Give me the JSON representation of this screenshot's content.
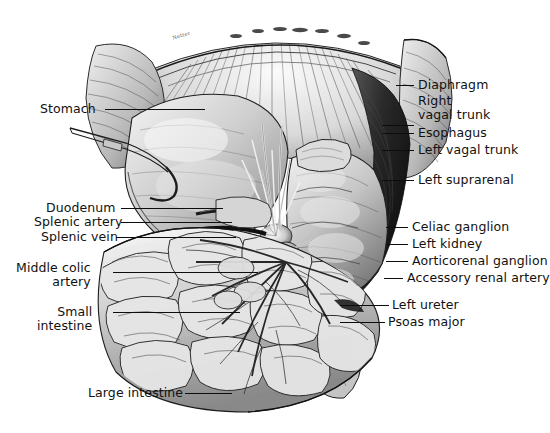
{
  "figure": {
    "signature": "Netter",
    "ink_color": "#0d0d0d",
    "label_color": "#111111",
    "background": "#ffffff"
  },
  "labels_right": [
    {
      "name": "diaphragm",
      "text": "Diaphragm",
      "x": 418,
      "y": 78,
      "line_x1": 396,
      "line_x2": 414,
      "line_y": 85
    },
    {
      "name": "right-vagal-trunk",
      "text": "Right\nvagal trunk",
      "x": 418,
      "y": 94,
      "line_x1": 382,
      "line_x2": 414,
      "line_y": 125
    },
    {
      "name": "esophagus",
      "text": "Esophagus",
      "x": 418,
      "y": 126,
      "line_x1": 382,
      "line_x2": 414,
      "line_y": 133
    },
    {
      "name": "left-vagal-trunk",
      "text": "Left vagal trunk",
      "x": 418,
      "y": 143,
      "line_x1": 382,
      "line_x2": 414,
      "line_y": 150
    },
    {
      "name": "left-suprarenal",
      "text": "Left suprarenal",
      "x": 418,
      "y": 173,
      "line_x1": 382,
      "line_x2": 414,
      "line_y": 180
    },
    {
      "name": "celiac-ganglion",
      "text": "Celiac ganglion",
      "x": 412,
      "y": 220,
      "line_x1": 386,
      "line_x2": 408,
      "line_y": 227
    },
    {
      "name": "left-kidney",
      "text": "Left kidney",
      "x": 412,
      "y": 237,
      "line_x1": 386,
      "line_x2": 408,
      "line_y": 244
    },
    {
      "name": "aorticorenal-ganglion",
      "text": "Aorticorenal ganglion",
      "x": 412,
      "y": 254,
      "line_x1": 386,
      "line_x2": 408,
      "line_y": 261
    },
    {
      "name": "accessory-renal-artery",
      "text": "Accessory renal artery",
      "x": 407,
      "y": 271,
      "line_x1": 384,
      "line_x2": 403,
      "line_y": 278
    },
    {
      "name": "left-ureter",
      "text": "Left ureter",
      "x": 392,
      "y": 298,
      "line_x1": 340,
      "line_x2": 389,
      "line_y": 305
    },
    {
      "name": "psoas-major",
      "text": "Psoas major",
      "x": 388,
      "y": 315,
      "line_x1": 340,
      "line_x2": 385,
      "line_y": 322
    }
  ],
  "labels_left": [
    {
      "name": "stomach",
      "text": "Stomach",
      "x": 40,
      "y": 102,
      "line_x1": 105,
      "line_x2": 205,
      "line_y": 109
    },
    {
      "name": "duodenum",
      "text": "Duodenum",
      "x": 46,
      "y": 201,
      "line_x1": 121,
      "line_x2": 223,
      "line_y": 208
    },
    {
      "name": "splenic-artery",
      "text": "Splenic artery",
      "x": 34,
      "y": 215,
      "line_x1": 121,
      "line_x2": 232,
      "line_y": 222
    },
    {
      "name": "splenic-vein",
      "text": "Splenic vein",
      "x": 41,
      "y": 230,
      "line_x1": 116,
      "line_x2": 236,
      "line_y": 237
    },
    {
      "name": "middle-colic-artery",
      "text": "Middle colic\nartery",
      "x": 16,
      "y": 261,
      "line_x1": 113,
      "line_x2": 258,
      "line_y": 272
    },
    {
      "name": "small-intestine",
      "text": "Small\nintestine",
      "x": 37,
      "y": 305,
      "line_x1": 113,
      "line_x2": 240,
      "line_y": 312
    },
    {
      "name": "large-intestine",
      "text": "Large intestine",
      "x": 88,
      "y": 386,
      "line_x1": 185,
      "line_x2": 232,
      "line_y": 393
    }
  ]
}
